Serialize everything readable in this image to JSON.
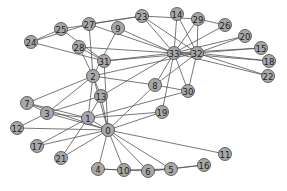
{
  "chart_data": {
    "type": "network",
    "title": "",
    "nodes": [
      {
        "id": "0",
        "x": 108,
        "y": 130
      },
      {
        "id": "1",
        "x": 88,
        "y": 118
      },
      {
        "id": "2",
        "x": 93,
        "y": 76
      },
      {
        "id": "3",
        "x": 47,
        "y": 113
      },
      {
        "id": "4",
        "x": 98,
        "y": 169
      },
      {
        "id": "5",
        "x": 171,
        "y": 169
      },
      {
        "id": "6",
        "x": 148,
        "y": 171
      },
      {
        "id": "7",
        "x": 27,
        "y": 103
      },
      {
        "id": "8",
        "x": 155,
        "y": 85
      },
      {
        "id": "9",
        "x": 118,
        "y": 28
      },
      {
        "id": "10",
        "x": 124,
        "y": 170
      },
      {
        "id": "11",
        "x": 225,
        "y": 154
      },
      {
        "id": "12",
        "x": 17,
        "y": 128
      },
      {
        "id": "13",
        "x": 101,
        "y": 96
      },
      {
        "id": "14",
        "x": 177,
        "y": 14
      },
      {
        "id": "15",
        "x": 261,
        "y": 48
      },
      {
        "id": "16",
        "x": 204,
        "y": 165
      },
      {
        "id": "17",
        "x": 37,
        "y": 146
      },
      {
        "id": "18",
        "x": 269,
        "y": 61
      },
      {
        "id": "19",
        "x": 162,
        "y": 112
      },
      {
        "id": "20",
        "x": 245,
        "y": 36
      },
      {
        "id": "21",
        "x": 61,
        "y": 158
      },
      {
        "id": "22",
        "x": 268,
        "y": 76
      },
      {
        "id": "23",
        "x": 142,
        "y": 16
      },
      {
        "id": "24",
        "x": 31,
        "y": 42
      },
      {
        "id": "25",
        "x": 61,
        "y": 29
      },
      {
        "id": "26",
        "x": 225,
        "y": 25
      },
      {
        "id": "27",
        "x": 89,
        "y": 24
      },
      {
        "id": "28",
        "x": 79,
        "y": 47
      },
      {
        "id": "29",
        "x": 198,
        "y": 19
      },
      {
        "id": "30",
        "x": 188,
        "y": 91
      },
      {
        "id": "31",
        "x": 104,
        "y": 61
      },
      {
        "id": "32",
        "x": 197,
        "y": 53
      },
      {
        "id": "33",
        "x": 174,
        "y": 53
      }
    ],
    "edges": [
      [
        0,
        1
      ],
      [
        0,
        2
      ],
      [
        0,
        3
      ],
      [
        0,
        4
      ],
      [
        0,
        5
      ],
      [
        0,
        6
      ],
      [
        0,
        7
      ],
      [
        0,
        8
      ],
      [
        0,
        10
      ],
      [
        0,
        11
      ],
      [
        0,
        12
      ],
      [
        0,
        13
      ],
      [
        0,
        17
      ],
      [
        0,
        19
      ],
      [
        0,
        21
      ],
      [
        0,
        31
      ],
      [
        1,
        2
      ],
      [
        1,
        3
      ],
      [
        1,
        7
      ],
      [
        1,
        13
      ],
      [
        1,
        17
      ],
      [
        1,
        19
      ],
      [
        1,
        21
      ],
      [
        1,
        30
      ],
      [
        2,
        3
      ],
      [
        2,
        7
      ],
      [
        2,
        8
      ],
      [
        2,
        9
      ],
      [
        2,
        13
      ],
      [
        2,
        27
      ],
      [
        2,
        28
      ],
      [
        2,
        32
      ],
      [
        3,
        7
      ],
      [
        3,
        12
      ],
      [
        3,
        13
      ],
      [
        4,
        6
      ],
      [
        4,
        10
      ],
      [
        5,
        6
      ],
      [
        5,
        10
      ],
      [
        5,
        16
      ],
      [
        6,
        16
      ],
      [
        8,
        30
      ],
      [
        8,
        32
      ],
      [
        8,
        33
      ],
      [
        9,
        33
      ],
      [
        13,
        33
      ],
      [
        14,
        32
      ],
      [
        14,
        33
      ],
      [
        15,
        32
      ],
      [
        15,
        33
      ],
      [
        18,
        32
      ],
      [
        18,
        33
      ],
      [
        19,
        33
      ],
      [
        20,
        32
      ],
      [
        20,
        33
      ],
      [
        22,
        32
      ],
      [
        22,
        33
      ],
      [
        23,
        25
      ],
      [
        23,
        27
      ],
      [
        23,
        29
      ],
      [
        23,
        32
      ],
      [
        23,
        33
      ],
      [
        24,
        25
      ],
      [
        24,
        27
      ],
      [
        24,
        31
      ],
      [
        25,
        31
      ],
      [
        26,
        29
      ],
      [
        26,
        33
      ],
      [
        27,
        33
      ],
      [
        28,
        31
      ],
      [
        28,
        33
      ],
      [
        29,
        32
      ],
      [
        29,
        33
      ],
      [
        30,
        32
      ],
      [
        30,
        33
      ],
      [
        31,
        32
      ],
      [
        31,
        33
      ],
      [
        32,
        33
      ]
    ],
    "node_color": "#a8a8a8",
    "edge_color": "#555555"
  }
}
